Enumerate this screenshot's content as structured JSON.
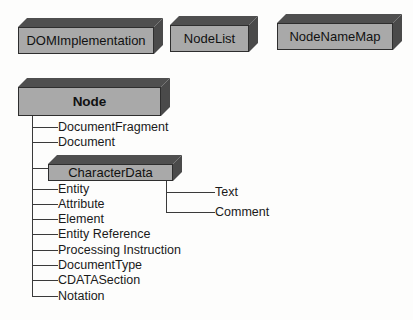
{
  "diagram": {
    "background_color": "#fdfdfc",
    "box_front_color": "#a9a9a9",
    "box_shade_color": "#4f4f4f",
    "line_color": "#3a3a3a",
    "text_color": "#111111"
  },
  "top_boxes": [
    {
      "label": "DOMImplementation",
      "x": 18,
      "y": 18,
      "w": 145,
      "h": 36
    },
    {
      "label": "NodeList",
      "x": 170,
      "y": 16,
      "w": 88,
      "h": 36
    },
    {
      "label": "NodeNameMap",
      "x": 277,
      "y": 14,
      "w": 125,
      "h": 36
    }
  ],
  "root_box": {
    "label": "Node",
    "x": 18,
    "y": 78,
    "w": 152,
    "h": 38
  },
  "character_data_box": {
    "label": "CharacterData",
    "x": 48,
    "y": 155,
    "w": 134,
    "h": 26
  },
  "node_children": [
    {
      "label": "DocumentFragment",
      "y": 127
    },
    {
      "label": "Document",
      "y": 142
    },
    {
      "label": "CharacterData",
      "y": 168,
      "is_box": true
    },
    {
      "label": "Entity",
      "y": 189
    },
    {
      "label": "Attribute",
      "y": 204
    },
    {
      "label": "Element",
      "y": 219
    },
    {
      "label": "Entity Reference",
      "y": 234
    },
    {
      "label": "Processing Instruction",
      "y": 250
    },
    {
      "label": "DocumentType",
      "y": 265
    },
    {
      "label": "CDATASection",
      "y": 280
    },
    {
      "label": "Notation",
      "y": 296
    }
  ],
  "character_data_children": [
    {
      "label": "Text",
      "y": 192
    },
    {
      "label": "Comment",
      "y": 212
    }
  ]
}
